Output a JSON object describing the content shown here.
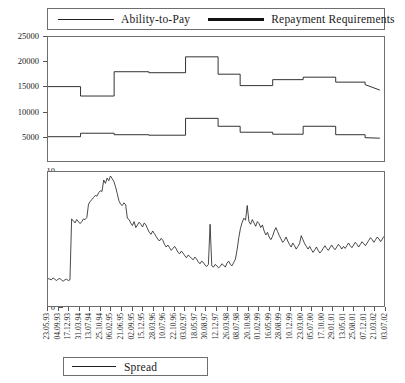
{
  "legend_top": {
    "entries": [
      {
        "label": "Ability-to-Pay",
        "style": "thin",
        "color": "#222222"
      },
      {
        "label": "Repayment Requirements",
        "style": "thick",
        "color": "#111111"
      }
    ]
  },
  "legend_bottom": {
    "entries": [
      {
        "label": "Spread",
        "style": "thin",
        "color": "#222222"
      }
    ]
  },
  "chart_data": [
    {
      "type": "line",
      "id": "top-panel",
      "title": "",
      "xlabel": "",
      "ylabel": "",
      "grid": false,
      "legend_position": "top",
      "ylim": [
        0,
        25000
      ],
      "yticks": [
        5000,
        10000,
        15000,
        20000,
        25000
      ],
      "ytick_labels": [
        "5000",
        "10000",
        "15000",
        "20000",
        "25000"
      ],
      "x_category_labels": [
        "23.05.93",
        "04.09.93",
        "17.12.93",
        "31.03.94",
        "13.07.94",
        "25.10.94",
        "06.02.95",
        "21.06.95",
        "02.09.95",
        "15.12.95",
        "28.03.96",
        "10.07.96",
        "22.10.96",
        "03.02.97",
        "18.05.97",
        "30.08.97",
        "12.12.97",
        "26.03.98",
        "08.07.98",
        "20.10.98",
        "01.02.99",
        "16.05.99",
        "28.08.99",
        "10.12.99",
        "23.03.00",
        "05.07.00",
        "17.10.00",
        "29.01.01",
        "13.05.01",
        "25.08.01",
        "07.12.01",
        "21.03.02",
        "03.07.02"
      ],
      "series": [
        {
          "name": "Ability-to-Pay",
          "style": "step",
          "x": [
            0,
            3.1,
            3.1,
            6.3,
            6.3,
            9.6,
            9.6,
            13.1,
            13.1,
            16.2,
            16.2,
            18.3,
            18.3,
            21.4,
            21.4,
            24.3,
            24.3,
            27.4,
            27.4,
            30.2,
            30.2,
            31.6
          ],
          "values": [
            15000,
            15000,
            13100,
            13100,
            18000,
            18000,
            17800,
            17800,
            21000,
            21000,
            17500,
            17500,
            15200,
            15200,
            16400,
            16400,
            16900,
            16900,
            15900,
            15900,
            15400,
            14300
          ]
        },
        {
          "name": "Repayment Requirements",
          "style": "step",
          "x": [
            0,
            3.1,
            3.1,
            6.3,
            6.3,
            9.6,
            9.6,
            13.1,
            13.1,
            16.2,
            16.2,
            18.3,
            18.3,
            21.4,
            21.4,
            24.3,
            24.3,
            27.4,
            27.4,
            30.2,
            30.2,
            31.6
          ],
          "values": [
            4900,
            4900,
            5600,
            5600,
            5300,
            5300,
            5200,
            5200,
            8600,
            8600,
            7000,
            7000,
            5800,
            5800,
            5400,
            5400,
            7000,
            7000,
            5300,
            5300,
            4700,
            4600
          ]
        }
      ]
    },
    {
      "type": "line",
      "id": "bottom-panel",
      "title": "",
      "xlabel": "",
      "ylabel": "",
      "grid": false,
      "legend_position": "bottom",
      "ylim": [
        0,
        10
      ],
      "yticks": [
        0,
        1,
        2,
        3,
        4,
        5,
        6,
        7,
        8,
        9,
        10
      ],
      "ytick_labels": [
        "0",
        "1",
        "2",
        "3",
        "4",
        "5",
        "6",
        "7",
        "8",
        "9",
        "10"
      ],
      "x_category_labels": [
        "23.05.93",
        "04.09.93",
        "17.12.93",
        "31.03.94",
        "13.07.94",
        "25.10.94",
        "06.02.95",
        "21.06.95",
        "02.09.95",
        "15.12.95",
        "28.03.96",
        "10.07.96",
        "22.10.96",
        "03.02.97",
        "18.05.97",
        "30.08.97",
        "12.12.97",
        "26.03.98",
        "08.07.98",
        "20.10.98",
        "01.02.99",
        "16.05.99",
        "28.08.99",
        "10.12.99",
        "23.03.00",
        "05.07.00",
        "17.10.00",
        "29.01.01",
        "13.05.01",
        "25.08.01",
        "07.12.01",
        "21.03.02",
        "03.07.02"
      ],
      "series": [
        {
          "name": "Spread",
          "style": "line",
          "values": [
            2.05,
            2.0,
            1.95,
            2.1,
            2.0,
            1.9,
            2.0,
            2.05,
            1.95,
            1.85,
            1.95,
            2.0,
            1.9,
            1.95,
            6.5,
            6.35,
            6.2,
            6.45,
            6.3,
            6.15,
            6.3,
            6.5,
            6.45,
            6.6,
            7.6,
            7.8,
            7.95,
            8.1,
            8.25,
            8.2,
            8.45,
            8.6,
            8.55,
            9.4,
            9.15,
            9.55,
            9.35,
            9.7,
            9.5,
            9.3,
            8.9,
            8.4,
            7.85,
            7.6,
            7.5,
            7.7,
            7.55,
            6.55,
            6.45,
            6.2,
            6.0,
            6.3,
            5.85,
            6.05,
            6.25,
            6.1,
            5.9,
            6.2,
            6.05,
            5.75,
            5.5,
            5.35,
            5.6,
            5.4,
            5.2,
            5.0,
            4.85,
            5.05,
            4.9,
            4.6,
            4.4,
            4.55,
            4.35,
            4.15,
            4.3,
            4.45,
            4.25,
            4.0,
            3.9,
            4.1,
            3.95,
            3.75,
            3.6,
            3.8,
            3.7,
            3.55,
            3.45,
            3.65,
            3.5,
            3.3,
            3.15,
            3.35,
            3.25,
            3.05,
            2.95,
            3.1,
            6.1,
            3.0,
            2.9,
            3.1,
            3.0,
            2.85,
            2.95,
            3.15,
            3.05,
            2.9,
            3.2,
            3.35,
            3.1,
            3.0,
            3.25,
            3.5,
            4.2,
            5.1,
            5.8,
            6.25,
            6.55,
            6.4,
            7.5,
            6.3,
            6.1,
            6.45,
            6.2,
            5.95,
            6.3,
            6.15,
            5.85,
            6.05,
            5.6,
            5.3,
            5.5,
            5.15,
            4.95,
            5.2,
            5.6,
            5.85,
            5.55,
            5.25,
            5.0,
            4.75,
            4.9,
            5.15,
            4.85,
            4.6,
            4.4,
            4.7,
            4.5,
            4.25,
            4.45,
            4.65,
            5.25,
            4.95,
            4.65,
            4.45,
            4.25,
            4.45,
            4.2,
            4.0,
            4.2,
            4.4,
            4.15,
            3.95,
            4.1,
            4.3,
            4.5,
            4.3,
            4.15,
            4.35,
            4.55,
            4.35,
            4.2,
            4.4,
            4.6,
            4.45,
            4.25,
            4.45,
            4.3,
            4.5,
            4.7,
            4.5,
            4.35,
            4.55,
            4.75,
            4.6,
            4.4,
            4.6,
            4.8,
            4.65,
            4.5,
            4.7,
            4.9,
            5.1,
            4.95,
            4.75,
            4.95,
            5.15,
            5.0,
            4.8,
            5.0,
            5.2
          ]
        }
      ]
    }
  ]
}
